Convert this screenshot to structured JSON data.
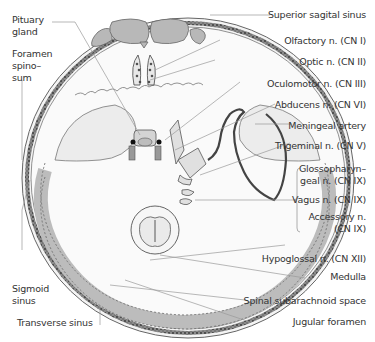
{
  "figure": {
    "colors": {
      "bone": "#d9d9d9",
      "bone_dark": "#a8a8a8",
      "sinus": "#b5b5b5",
      "line": "#555555",
      "label_line": "#9a9a9a",
      "artery": "#555555",
      "text": "#333333"
    }
  },
  "labels_left": [
    {
      "id": "pituitary",
      "text": "Pituary\ngland",
      "line1": "Pituary",
      "line2": "gland"
    },
    {
      "id": "foramen-spinosum",
      "line1": "Foramen",
      "line2": "spino–",
      "line3": "sum"
    },
    {
      "id": "sigmoid-sinus",
      "line1": "Sigmoid",
      "line2": "sinus"
    },
    {
      "id": "transverse-sinus",
      "line1": "Transverse sinus"
    }
  ],
  "labels_right": [
    {
      "id": "superior-sagital-sinus",
      "text": "Superior sagital sinus"
    },
    {
      "id": "olfactory",
      "text": "Olfactory n. (CN I)"
    },
    {
      "id": "optic",
      "text": "Optic n. (CN II)"
    },
    {
      "id": "oculomotor",
      "text": "Oculomotor n. (CN III)"
    },
    {
      "id": "abducens",
      "text": "Abducens n. (CN VI)"
    },
    {
      "id": "meningeal-artery",
      "text": "Meningeal artery"
    },
    {
      "id": "trigeminal",
      "text": "Trigeminal n. (CN V)"
    },
    {
      "id": "glossopharyngeal",
      "line1": "Glossopharyn–",
      "line2": "geal n. (CN IX)"
    },
    {
      "id": "vagus",
      "text": "Vagus n. (CN IX)"
    },
    {
      "id": "accessory",
      "line1": "Accessory n.",
      "line2": "(CN IX)"
    },
    {
      "id": "hypoglossal",
      "text": "Hypoglossal n. (CN XII)"
    },
    {
      "id": "medulla",
      "text": "Medulla"
    },
    {
      "id": "spinal-subarachnoid",
      "text": "Spinal subarachnoid space"
    },
    {
      "id": "jugular-foramen",
      "text": "Jugular foramen"
    }
  ]
}
